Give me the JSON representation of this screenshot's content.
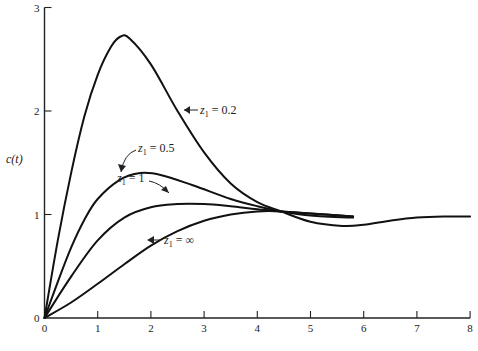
{
  "chart_data": {
    "type": "line",
    "title": "",
    "xlabel": "",
    "ylabel": "c(t)",
    "xlim": [
      0,
      8
    ],
    "ylim": [
      0,
      3
    ],
    "x_ticks": [
      "0",
      "1",
      "2",
      "3",
      "4",
      "5",
      "6",
      "7",
      "8"
    ],
    "y_ticks": [
      "0",
      "1",
      "2",
      "3"
    ],
    "grid": false,
    "legend": "none (inline annotations with arrows)",
    "series": [
      {
        "name": "z1 = 0.2",
        "annotation": {
          "var": "z",
          "sub": "1",
          "text": " = 0.2"
        },
        "x": [
          0,
          0.25,
          0.5,
          0.75,
          1,
          1.25,
          1.43,
          1.6,
          2,
          2.5,
          3,
          3.5,
          4,
          4.45,
          5,
          5.6,
          6,
          6.5,
          7,
          7.5,
          8
        ],
        "y": [
          0,
          0.75,
          1.4,
          1.95,
          2.35,
          2.62,
          2.72,
          2.7,
          2.45,
          2.0,
          1.6,
          1.3,
          1.12,
          1.03,
          0.93,
          0.89,
          0.9,
          0.94,
          0.97,
          0.98,
          0.98
        ]
      },
      {
        "name": "z1 = 0.5",
        "annotation": {
          "var": "z",
          "sub": "1",
          "text": " = 0.5"
        },
        "x": [
          0,
          0.25,
          0.5,
          0.75,
          1,
          1.4,
          1.8,
          2.2,
          2.8,
          3.5,
          4,
          4.45,
          5,
          5.8
        ],
        "y": [
          0,
          0.35,
          0.68,
          0.95,
          1.15,
          1.33,
          1.4,
          1.38,
          1.28,
          1.15,
          1.08,
          1.03,
          0.99,
          0.97
        ]
      },
      {
        "name": "z1 = 1",
        "annotation": {
          "var": "z",
          "sub": "1",
          "text": " = 1"
        },
        "x": [
          0,
          0.5,
          1,
          1.5,
          2,
          2.5,
          3,
          3.5,
          4,
          4.45,
          5,
          5.8
        ],
        "y": [
          0,
          0.4,
          0.75,
          0.97,
          1.07,
          1.1,
          1.1,
          1.08,
          1.05,
          1.03,
          1.01,
          0.98
        ]
      },
      {
        "name": "z1 = ∞",
        "annotation": {
          "var": "z",
          "sub": "1",
          "text": " = ∞"
        },
        "x": [
          0,
          0.5,
          1,
          1.5,
          2,
          2.5,
          3,
          3.5,
          4,
          4.45,
          5,
          5.8
        ],
        "y": [
          0,
          0.15,
          0.33,
          0.52,
          0.7,
          0.84,
          0.94,
          1.0,
          1.03,
          1.03,
          1.01,
          0.98
        ]
      }
    ]
  }
}
